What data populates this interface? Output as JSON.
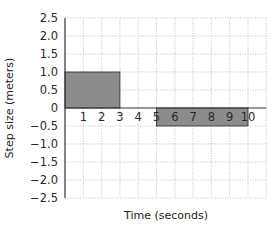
{
  "chart_data": {
    "type": "bar",
    "title": "",
    "xlabel": "Time (seconds)",
    "ylabel": "Step size (meters)",
    "xlim": [
      0,
      11
    ],
    "ylim": [
      -2.5,
      2.5
    ],
    "grid": true,
    "grid_style": "dotted",
    "legend": null,
    "x_ticks": [
      "1",
      "2",
      "3",
      "4",
      "5",
      "6",
      "7",
      "8",
      "9",
      "10"
    ],
    "y_ticks": [
      "2.5",
      "2.0",
      "1.5",
      "1.0",
      "0.5",
      "0",
      "−0.5",
      "−1.0",
      "−1.5",
      "−2.0",
      "−2.5"
    ],
    "bars": [
      {
        "x_start": 0,
        "x_end": 3,
        "value": 1.0
      },
      {
        "x_start": 5,
        "x_end": 10,
        "value": -0.5
      }
    ],
    "bar_color": "#8c8c8c",
    "bar_border": "#2a2a2a"
  }
}
